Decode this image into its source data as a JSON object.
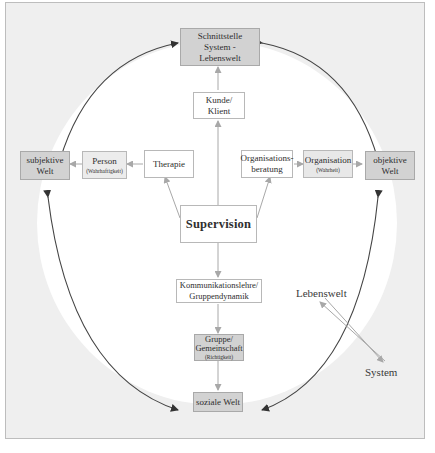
{
  "diagram": {
    "nodes": {
      "interface": {
        "line1": "Schnittstelle",
        "line2": "System -",
        "line3": "Lebenswelt"
      },
      "client": {
        "label": "Kunde/ Klient"
      },
      "subjective": {
        "line1": "subjektive",
        "line2": "Welt"
      },
      "person": {
        "label": "Person",
        "sub": "(Wahrhaftigkeit)"
      },
      "therapy": {
        "label": "Therapie"
      },
      "org_consulting": {
        "line1": "Organisations-",
        "line2": "beratung"
      },
      "organisation": {
        "label": "Organisation",
        "sub": "(Wahrheit)"
      },
      "objective": {
        "line1": "objektive",
        "line2": "Welt"
      },
      "supervision": {
        "label": "Supervision"
      },
      "communication": {
        "line1": "Kommunikationslehre/",
        "line2": "Gruppendynamik"
      },
      "group": {
        "line1": "Gruppe/",
        "line2": "Gemeinschaft",
        "sub": "(Richtigkeit)"
      },
      "social": {
        "label": "soziale Welt"
      }
    },
    "legend": {
      "top": "Lebenswelt",
      "bottom": "System"
    },
    "colors": {
      "background_outer": "#efefef",
      "circle_inner": "#ffffff",
      "grey_box": "#d2d2d2",
      "dark_arrow": "#3a3a3a",
      "light_arrow": "#a8a8a8"
    }
  }
}
